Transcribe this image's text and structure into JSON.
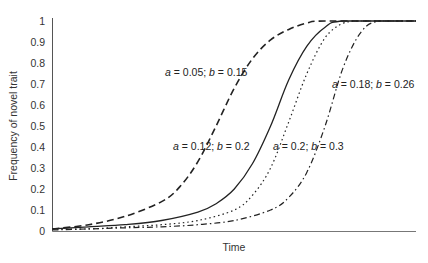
{
  "chart_data": {
    "type": "line",
    "title": "",
    "xlabel": "Time",
    "ylabel": "Frequency of novel trait",
    "ylim": [
      0,
      1
    ],
    "xlim": [
      0,
      100
    ],
    "yticks": [
      "0",
      "0.1",
      "0.2",
      "0.3",
      "0.4",
      "0.5",
      "0.6",
      "0.7",
      "0.8",
      "0.9",
      "1"
    ],
    "grid": false,
    "legend": "inline annotations",
    "series": [
      {
        "name": "a = 0.05; b = 0.15",
        "style": "dashed",
        "x": [
          0,
          10,
          20,
          30,
          35,
          40,
          45,
          50,
          55,
          60,
          65,
          70,
          75,
          100
        ],
        "values": [
          0.01,
          0.03,
          0.07,
          0.14,
          0.21,
          0.33,
          0.5,
          0.68,
          0.82,
          0.91,
          0.96,
          0.99,
          1.0,
          1.0
        ]
      },
      {
        "name": "a = 0.12; b = 0.2",
        "style": "solid",
        "x": [
          0,
          10,
          20,
          30,
          40,
          45,
          50,
          55,
          60,
          65,
          70,
          75,
          80,
          100
        ],
        "values": [
          0.01,
          0.02,
          0.03,
          0.05,
          0.09,
          0.13,
          0.2,
          0.32,
          0.5,
          0.72,
          0.88,
          0.97,
          1.0,
          1.0
        ]
      },
      {
        "name": "a = 0.2; b = 0.3",
        "style": "dotted",
        "x": [
          0,
          10,
          20,
          30,
          40,
          50,
          55,
          60,
          65,
          70,
          75,
          80,
          85,
          100
        ],
        "values": [
          0.01,
          0.01,
          0.02,
          0.03,
          0.05,
          0.1,
          0.17,
          0.3,
          0.52,
          0.75,
          0.92,
          0.99,
          1.0,
          1.0
        ]
      },
      {
        "name": "a = 0.18; b = 0.26",
        "style": "dash-dot",
        "x": [
          0,
          10,
          20,
          30,
          40,
          50,
          60,
          65,
          70,
          75,
          80,
          85,
          90,
          100
        ],
        "values": [
          0.005,
          0.01,
          0.015,
          0.02,
          0.03,
          0.05,
          0.1,
          0.16,
          0.28,
          0.5,
          0.78,
          0.95,
          1.0,
          1.0
        ]
      }
    ],
    "annotations": [
      {
        "text": "a = 0.05; b = 0.15",
        "a": "0.05",
        "b": "0.15"
      },
      {
        "text": "a = 0.12; b = 0.2",
        "a": "0.12",
        "b": "0.2"
      },
      {
        "text": "a = 0.2; b = 0.3",
        "a": "0.2",
        "b": "0.3"
      },
      {
        "text": "a = 0.18; b = 0.26",
        "a": "0.18",
        "b": "0.26"
      }
    ]
  }
}
